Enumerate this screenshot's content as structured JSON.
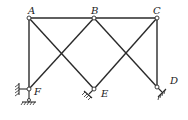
{
  "diagram": {
    "type": "truss",
    "stroke_color": "#2a2a2a",
    "nodes": {
      "A": {
        "label": "A",
        "x": 29,
        "y": 18
      },
      "B": {
        "label": "B",
        "x": 94,
        "y": 18
      },
      "C": {
        "label": "C",
        "x": 157,
        "y": 18
      },
      "D": {
        "label": "D",
        "x": 157,
        "y": 87
      },
      "E": {
        "label": "E",
        "x": 94,
        "y": 89
      },
      "F": {
        "label": "F",
        "x": 29,
        "y": 89
      }
    },
    "members": [
      [
        "A",
        "B"
      ],
      [
        "B",
        "C"
      ],
      [
        "A",
        "F"
      ],
      [
        "C",
        "D"
      ],
      [
        "A",
        "E"
      ],
      [
        "B",
        "F"
      ],
      [
        "B",
        "D"
      ],
      [
        "C",
        "E"
      ]
    ],
    "supports": [
      {
        "node": "F",
        "type": "fixed-pin-wall-and-ground"
      },
      {
        "node": "E",
        "type": "pin-inclined"
      },
      {
        "node": "D",
        "type": "pin-inclined"
      }
    ]
  }
}
